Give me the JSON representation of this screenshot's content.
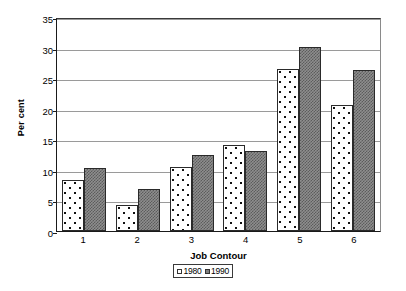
{
  "chart_data": {
    "type": "bar",
    "title": "",
    "xlabel": "Job Contour",
    "ylabel": "Per cent",
    "categories": [
      "1",
      "2",
      "3",
      "4",
      "5",
      "6"
    ],
    "ylim": [
      0,
      35
    ],
    "yticks": [
      0,
      5,
      10,
      15,
      20,
      25,
      30,
      35
    ],
    "grid": true,
    "legend_position": "bottom",
    "series": [
      {
        "name": "1980",
        "values": [
          8.3,
          4.3,
          10.4,
          14.1,
          26.5,
          20.6
        ]
      },
      {
        "name": "1990",
        "values": [
          10.3,
          6.8,
          12.5,
          13.1,
          30.1,
          26.3
        ]
      }
    ]
  },
  "axes": {
    "y_tick_labels": [
      "0",
      "5",
      "10",
      "15",
      "20",
      "25",
      "30",
      "35"
    ],
    "x_tick_labels": [
      "1",
      "2",
      "3",
      "4",
      "5",
      "6"
    ],
    "y_title": "Per cent",
    "x_title": "Job Contour"
  },
  "legend": {
    "items": [
      {
        "label": "1980",
        "swatch": "dotted-white-swatch"
      },
      {
        "label": "1990",
        "swatch": "gray-checker-swatch"
      }
    ]
  },
  "colors": {
    "series_1980_fill": "#ffffff",
    "series_1980_dots": "#111111",
    "series_1990_fill": "#8e8e8e",
    "series_1990_pattern": "#5c5c5c",
    "axis": "#1a1a1a",
    "gridline": "#9a9a9a",
    "background": "#ffffff"
  }
}
